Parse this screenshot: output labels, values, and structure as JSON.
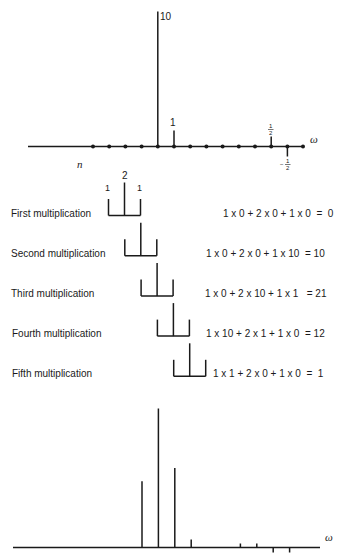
{
  "figure": {
    "input_signal": {
      "axis_label": "ω",
      "index_label": "n",
      "samples": [
        0,
        0,
        0,
        0,
        10,
        1,
        0,
        0,
        0,
        0,
        0,
        0.5,
        -0.5
      ],
      "value_labels": {
        "peak": "10",
        "one": "1",
        "half_num": "1",
        "half_den": "2",
        "neg_half_sign": "−",
        "neg_half_num": "1",
        "neg_half_den": "2"
      }
    },
    "kernel": {
      "weights": [
        1,
        2,
        1
      ],
      "labels": [
        "1",
        "2",
        "1"
      ]
    },
    "steps": [
      {
        "label": "First multiplication",
        "equation": "1 x 0 + 2 x 0 + 1 x 0  =  0",
        "result": 0,
        "offset": 0
      },
      {
        "label": "Second multiplication",
        "equation": "1 x 0 + 2 x 0 + 1 x 10  = 10",
        "result": 10,
        "offset": 1
      },
      {
        "label": "Third multiplication",
        "equation": "1 x 0 + 2 x 10 + 1 x 1   = 21",
        "result": 21,
        "offset": 2
      },
      {
        "label": "Fourth multiplication",
        "equation": "1 x 10 + 2 x 1 + 1 x 0  = 12",
        "result": 12,
        "offset": 3
      },
      {
        "label": "Fifth multiplication",
        "equation": "1 x 1 + 2 x 0 + 1 x 0  =  1",
        "result": 1,
        "offset": 4
      }
    ],
    "output_signal": {
      "axis_label": "ω",
      "samples": [
        10,
        21,
        12,
        1,
        0,
        0,
        1,
        1,
        -1,
        -1
      ]
    }
  }
}
